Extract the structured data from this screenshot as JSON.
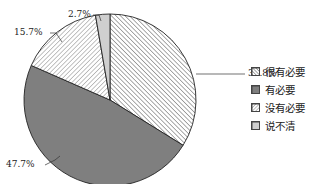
{
  "chart_data": {
    "type": "pie",
    "title": "",
    "categories": [
      "很有必要",
      "有必要",
      "没有必要",
      "说不清"
    ],
    "values": [
      33.8,
      47.7,
      15.7,
      2.7
    ],
    "labels": [
      "33.8%",
      "47.7%",
      "15.7%",
      "2.7%"
    ],
    "start_angle": "12 o'clock",
    "direction": "clockwise",
    "legend_position": "right",
    "fills": [
      {
        "pattern": "hatch-back-diagonal-dense",
        "color": "#555555"
      },
      {
        "pattern": "solid",
        "color": "#7f7f7f"
      },
      {
        "pattern": "hatch-forward-diagonal",
        "color": "#777777"
      },
      {
        "pattern": "solid",
        "color": "#cfcfcf"
      }
    ]
  },
  "legend": {
    "items": [
      {
        "label": "很有必要"
      },
      {
        "label": "有必要"
      },
      {
        "label": "没有必要"
      },
      {
        "label": "说不清"
      }
    ]
  }
}
